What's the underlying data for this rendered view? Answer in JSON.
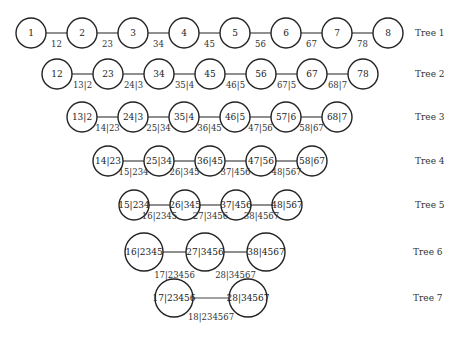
{
  "trees": [
    {
      "label": "Tree 1",
      "y": 33,
      "r": 15,
      "label_x": 415,
      "nodes": [
        {
          "x": 31,
          "text": "1"
        },
        {
          "x": 82,
          "text": "2"
        },
        {
          "x": 133,
          "text": "3"
        },
        {
          "x": 184,
          "text": "4"
        },
        {
          "x": 235,
          "text": "5"
        },
        {
          "x": 286,
          "text": "6"
        },
        {
          "x": 337,
          "text": "7"
        },
        {
          "x": 388,
          "text": "8"
        }
      ],
      "edges": [
        "12",
        "23",
        "34",
        "45",
        "56",
        "67",
        "78"
      ]
    },
    {
      "label": "Tree 2",
      "y": 74,
      "r": 15,
      "label_x": 415,
      "nodes": [
        {
          "x": 57,
          "text": "12"
        },
        {
          "x": 108,
          "text": "23"
        },
        {
          "x": 159,
          "text": "34"
        },
        {
          "x": 210,
          "text": "45"
        },
        {
          "x": 261,
          "text": "56"
        },
        {
          "x": 312,
          "text": "67"
        },
        {
          "x": 363,
          "text": "78"
        }
      ],
      "edges": [
        "13|2",
        "24|3",
        "35|4",
        "46|5",
        "67|5",
        "68|7"
      ]
    },
    {
      "label": "Tree 3",
      "y": 117,
      "r": 15,
      "label_x": 415,
      "nodes": [
        {
          "x": 82,
          "text": "13|2"
        },
        {
          "x": 133,
          "text": "24|3"
        },
        {
          "x": 184,
          "text": "35|4"
        },
        {
          "x": 235,
          "text": "46|5"
        },
        {
          "x": 286,
          "text": "57|6"
        },
        {
          "x": 337,
          "text": "68|7"
        }
      ],
      "edges": [
        "14|23",
        "25|34",
        "36|45",
        "47|56",
        "58|67"
      ]
    },
    {
      "label": "Tree 4",
      "y": 161,
      "r": 15,
      "label_x": 415,
      "nodes": [
        {
          "x": 108,
          "text": "14|23"
        },
        {
          "x": 159,
          "text": "25|34"
        },
        {
          "x": 210,
          "text": "36|45"
        },
        {
          "x": 261,
          "text": "47|56"
        },
        {
          "x": 312,
          "text": "58|67"
        }
      ],
      "edges": [
        "15|234",
        "26|345",
        "37|456",
        "48|567"
      ]
    },
    {
      "label": "Tree 5",
      "y": 205,
      "r": 15,
      "label_x": 415,
      "nodes": [
        {
          "x": 134,
          "text": "15|234"
        },
        {
          "x": 185,
          "text": "26|345"
        },
        {
          "x": 236,
          "text": "37|456"
        },
        {
          "x": 287,
          "text": "48|567"
        }
      ],
      "edges": [
        "16|2345",
        "27|3456",
        "38|4567"
      ]
    },
    {
      "label": "Tree 6",
      "y": 252,
      "r": 19,
      "label_x": 413,
      "nodes": [
        {
          "x": 144,
          "text": "16|2345"
        },
        {
          "x": 205,
          "text": "27|3456"
        },
        {
          "x": 266,
          "text": "38|4567"
        }
      ],
      "edges": [
        "17|23456",
        "28|34567"
      ],
      "edge_label_dy": 26
    },
    {
      "label": "Tree 7",
      "y": 298,
      "r": 19,
      "label_x": 413,
      "nodes": [
        {
          "x": 174,
          "text": "17|23456"
        },
        {
          "x": 248,
          "text": "28|34567"
        }
      ],
      "edges": [
        "18|234567"
      ],
      "edge_label_dy": 22
    }
  ]
}
